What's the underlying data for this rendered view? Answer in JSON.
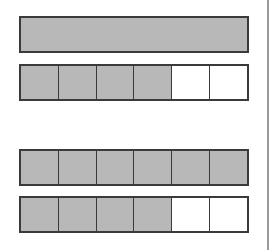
{
  "colors": {
    "shaded": "#b8b8b8",
    "unshaded": "#ffffff",
    "border": "#3a3a3a"
  },
  "bars": [
    {
      "id": "whole-1",
      "top": 16,
      "segments": [
        {
          "shaded": true
        }
      ]
    },
    {
      "id": "sixths-4-shaded-a",
      "top": 64,
      "segments": [
        {
          "shaded": true
        },
        {
          "shaded": true
        },
        {
          "shaded": true
        },
        {
          "shaded": true
        },
        {
          "shaded": false
        },
        {
          "shaded": false
        }
      ]
    },
    {
      "id": "sixths-6-shaded",
      "top": 149,
      "segments": [
        {
          "shaded": true
        },
        {
          "shaded": true
        },
        {
          "shaded": true
        },
        {
          "shaded": true
        },
        {
          "shaded": true
        },
        {
          "shaded": true
        }
      ]
    },
    {
      "id": "sixths-4-shaded-b",
      "top": 196,
      "segments": [
        {
          "shaded": true
        },
        {
          "shaded": true
        },
        {
          "shaded": true
        },
        {
          "shaded": true
        },
        {
          "shaded": false
        },
        {
          "shaded": false
        }
      ]
    }
  ]
}
